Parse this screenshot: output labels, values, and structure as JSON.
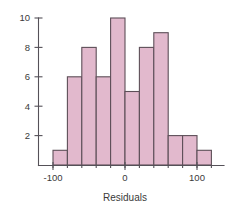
{
  "chart_data": {
    "type": "bar",
    "title": "",
    "subtitle": "",
    "xlabel": "Residuals",
    "ylabel": "",
    "bin_width": 20,
    "bin_starts": [
      -100,
      -80,
      -60,
      -40,
      -20,
      0,
      20,
      40,
      60,
      80,
      100
    ],
    "bin_ends": [
      -80,
      -60,
      -40,
      -20,
      0,
      20,
      40,
      60,
      80,
      100,
      120
    ],
    "categories": [
      "-100 to -80",
      "-80 to -60",
      "-60 to -40",
      "-40 to -20",
      "-20 to 0",
      "0 to 20",
      "20 to 40",
      "40 to 60",
      "60 to 80",
      "80 to 100",
      "100 to 120"
    ],
    "values": [
      1,
      6,
      8,
      6,
      10,
      5,
      8,
      9,
      2,
      2,
      1
    ],
    "xlim": [
      -130,
      130
    ],
    "ylim": [
      0,
      10.6
    ],
    "xticks": [
      -100,
      0,
      100
    ],
    "xtick_labels": [
      "-100",
      "0",
      "100"
    ],
    "yticks": [
      2,
      4,
      6,
      8,
      10
    ],
    "ytick_labels": [
      "2",
      "4",
      "6",
      "8",
      "10"
    ],
    "grid": false,
    "legend": false,
    "bar_fill_color": "#e2b9cd",
    "bar_edge_color": "#5d4f58",
    "axis_color": "#555158",
    "background_color": "#ffffff"
  }
}
